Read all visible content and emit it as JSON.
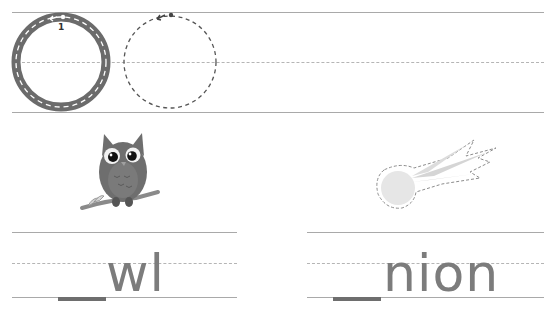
{
  "worksheet": {
    "tracing_row": {
      "letter": "O",
      "stroke_number": "1",
      "models": [
        {
          "type": "solid-guide"
        },
        {
          "type": "dashed-trace"
        }
      ]
    },
    "pictures": [
      {
        "name": "owl",
        "icon": "owl-icon"
      },
      {
        "name": "onion",
        "icon": "onion-outline-icon"
      }
    ],
    "words": [
      {
        "blank": "_",
        "text": "wl",
        "answer_picture": "owl"
      },
      {
        "blank": "_",
        "text": "nion",
        "answer_picture": "onion"
      }
    ],
    "colors": {
      "line": "#a9a9a9",
      "dash": "#b5b5b5",
      "letter": "#7c7c7c",
      "guide_ring": "#6b6b6b",
      "owl_body": "#6e6e6e",
      "onion_fill": "#e6e6e6"
    }
  }
}
